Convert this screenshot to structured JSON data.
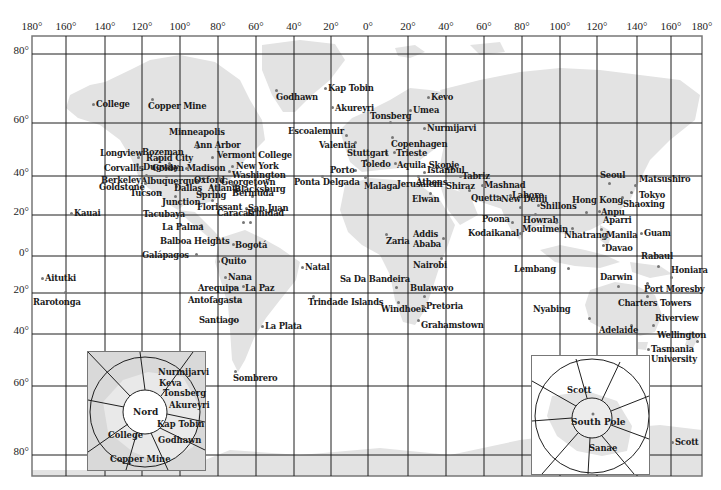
{
  "map": {
    "frame": {
      "left": 32,
      "top": 36,
      "right": 702,
      "bottom": 476
    },
    "colors": {
      "land": "#e3e3e3",
      "grid": "#1f1f1f",
      "frame": "#777777",
      "dot": "#777777",
      "background": "#ffffff"
    },
    "longitude_ticks": [
      {
        "label": "180°",
        "x": 32
      },
      {
        "label": "160°",
        "x": 66
      },
      {
        "label": "140°",
        "x": 105
      },
      {
        "label": "120°",
        "x": 142
      },
      {
        "label": "100°",
        "x": 180
      },
      {
        "label": "80°",
        "x": 218
      },
      {
        "label": "60°",
        "x": 256
      },
      {
        "label": "40°",
        "x": 294
      },
      {
        "label": "20°",
        "x": 331
      },
      {
        "label": "0°",
        "x": 368
      },
      {
        "label": "20°",
        "x": 408
      },
      {
        "label": "40°",
        "x": 446
      },
      {
        "label": "60°",
        "x": 484
      },
      {
        "label": "80°",
        "x": 522
      },
      {
        "label": "100°",
        "x": 560
      },
      {
        "label": "120°",
        "x": 597
      },
      {
        "label": "140°",
        "x": 637
      },
      {
        "label": "160°",
        "x": 671
      },
      {
        "label": "180°",
        "x": 702
      }
    ],
    "latitude_ticks": [
      {
        "label": "80°",
        "y": 54
      },
      {
        "label": "60°",
        "y": 123
      },
      {
        "label": "40°",
        "y": 176
      },
      {
        "label": "20°",
        "y": 215
      },
      {
        "label": "0°",
        "y": 256
      },
      {
        "label": "20°",
        "y": 293
      },
      {
        "label": "40°",
        "y": 334
      },
      {
        "label": "60°",
        "y": 386
      },
      {
        "label": "80°",
        "y": 455
      }
    ],
    "stations": [
      {
        "name": "College",
        "x": 93,
        "y": 104,
        "dx": 3,
        "dy": -4
      },
      {
        "name": "Copper Mine",
        "x": 152,
        "y": 99,
        "dx": -4,
        "dy": 3
      },
      {
        "name": "Godhawn",
        "x": 276,
        "y": 90,
        "dx": 0,
        "dy": 3
      },
      {
        "name": "Kap Tobin",
        "x": 325,
        "y": 88,
        "dx": 3,
        "dy": -4
      },
      {
        "name": "Akureyri",
        "x": 332,
        "y": 107,
        "dx": 3,
        "dy": -3
      },
      {
        "name": "Kevo",
        "x": 428,
        "y": 97,
        "dx": 3,
        "dy": -4
      },
      {
        "name": "Umea",
        "x": 410,
        "y": 110,
        "dx": 3,
        "dy": -4
      },
      {
        "name": "Tonsberg",
        "x": 390,
        "y": 122,
        "dx": -20,
        "dy": -10
      },
      {
        "name": "Nurmijarvi",
        "x": 424,
        "y": 128,
        "dx": 3,
        "dy": -4
      },
      {
        "name": "Escoalemuir",
        "x": 346,
        "y": 135,
        "dx": -58,
        "dy": -8
      },
      {
        "name": "Copenhagen",
        "x": 392,
        "y": 137,
        "dx": -1,
        "dy": 3
      },
      {
        "name": "Valentia",
        "x": 355,
        "y": 142,
        "dx": -36,
        "dy": -1
      },
      {
        "name": "Stuttgart",
        "x": 386,
        "y": 153,
        "dx": -39,
        "dy": -4
      },
      {
        "name": "Trieste",
        "x": 394,
        "y": 152,
        "dx": 2,
        "dy": -3
      },
      {
        "name": "Toledo",
        "x": 366,
        "y": 160,
        "dx": -5,
        "dy": 0
      },
      {
        "name": "Aquila Skopje",
        "x": 395,
        "y": 163,
        "dx": 2,
        "dy": -2
      },
      {
        "name": "Porto",
        "x": 355,
        "y": 170,
        "dx": -25,
        "dy": -4
      },
      {
        "name": "Malaga",
        "x": 365,
        "y": 177,
        "dx": -1,
        "dy": 5
      },
      {
        "name": "Ponta Delgada",
        "x": 322,
        "y": 176,
        "dx": -28,
        "dy": 2
      },
      {
        "name": "Istanbul",
        "x": 424,
        "y": 172,
        "dx": 3,
        "dy": -6
      },
      {
        "name": "Athens",
        "x": 418,
        "y": 176,
        "dx": -2,
        "dy": 2
      },
      {
        "name": "Tabriz",
        "x": 460,
        "y": 176,
        "dx": 2,
        "dy": -4
      },
      {
        "name": "Jerusalem",
        "x": 434,
        "y": 185,
        "dx": -37,
        "dy": -5
      },
      {
        "name": "Shiraz",
        "x": 469,
        "y": 190,
        "dx": -23,
        "dy": -8
      },
      {
        "name": "Elwan",
        "x": 430,
        "y": 193,
        "dx": -18,
        "dy": 2
      },
      {
        "name": "Mashnad",
        "x": 482,
        "y": 185,
        "dx": 2,
        "dy": -4
      },
      {
        "name": "Quetta",
        "x": 497,
        "y": 196,
        "dx": -26,
        "dy": -2
      },
      {
        "name": "Lahore",
        "x": 510,
        "y": 195,
        "dx": 2,
        "dy": -4
      },
      {
        "name": "New Dehli",
        "x": 520,
        "y": 207,
        "dx": -19,
        "dy": -12
      },
      {
        "name": "Poona",
        "x": 512,
        "y": 222,
        "dx": -30,
        "dy": -7
      },
      {
        "name": "Kodaikanal",
        "x": 520,
        "y": 233,
        "dx": -52,
        "dy": -4
      },
      {
        "name": "Shillons",
        "x": 538,
        "y": 205,
        "dx": 2,
        "dy": -3
      },
      {
        "name": "Howrah",
        "x": 535,
        "y": 214,
        "dx": -12,
        "dy": 2
      },
      {
        "name": "Mouimein",
        "x": 556,
        "y": 222,
        "dx": -34,
        "dy": 3
      },
      {
        "name": "Hong Kong",
        "x": 586,
        "y": 212,
        "dx": -14,
        "dy": -16
      },
      {
        "name": "Nhatrang",
        "x": 572,
        "y": 228,
        "dx": -8,
        "dy": 3
      },
      {
        "name": "Seoul",
        "x": 609,
        "y": 183,
        "dx": -9,
        "dy": -12
      },
      {
        "name": "Matsushiro",
        "x": 635,
        "y": 185,
        "dx": 4,
        "dy": -10
      },
      {
        "name": "Tokyo",
        "x": 631,
        "y": 192,
        "dx": 8,
        "dy": -1
      },
      {
        "name": "Shaoxing",
        "x": 622,
        "y": 197,
        "dx": 1,
        "dy": 3
      },
      {
        "name": "Anpu",
        "x": 599,
        "y": 211,
        "dx": 2,
        "dy": -3
      },
      {
        "name": "Aparri",
        "x": 601,
        "y": 229,
        "dx": 2,
        "dy": -13
      },
      {
        "name": "Manila",
        "x": 604,
        "y": 237,
        "dx": 2,
        "dy": -6
      },
      {
        "name": "Davao",
        "x": 603,
        "y": 245,
        "dx": 2,
        "dy": -1
      },
      {
        "name": "Guam",
        "x": 641,
        "y": 233,
        "dx": 3,
        "dy": -4
      },
      {
        "name": "Rabaul",
        "x": 658,
        "y": 266,
        "dx": -17,
        "dy": -14
      },
      {
        "name": "Honiara",
        "x": 671,
        "y": 277,
        "dx": 0,
        "dy": -11
      },
      {
        "name": "Darwin",
        "x": 618,
        "y": 286,
        "dx": -18,
        "dy": -13
      },
      {
        "name": "Port Moresby",
        "x": 647,
        "y": 283,
        "dx": -3,
        "dy": 2
      },
      {
        "name": "Lembang",
        "x": 568,
        "y": 268,
        "dx": -54,
        "dy": -3
      },
      {
        "name": "Charters Towers",
        "x": 647,
        "y": 296,
        "dx": -29,
        "dy": 3
      },
      {
        "name": "Nyabing",
        "x": 589,
        "y": 318,
        "dx": -56,
        "dy": -13
      },
      {
        "name": "Riverview",
        "x": 653,
        "y": 325,
        "dx": 2,
        "dy": -11
      },
      {
        "name": "Adelaide",
        "x": 631,
        "y": 325,
        "dx": -32,
        "dy": 1
      },
      {
        "name": "Wellington",
        "x": 697,
        "y": 341,
        "dx": -40,
        "dy": -10
      },
      {
        "name": "Tasmania",
        "x": 648,
        "y": 349,
        "dx": 3,
        "dy": -4
      },
      {
        "name": "University",
        "x": 648,
        "y": 349,
        "dx": 3,
        "dy": 6,
        "nodot": true
      },
      {
        "name": "Scott",
        "x": 672,
        "y": 442,
        "dx": 3,
        "dy": -4
      },
      {
        "name": "Kauai",
        "x": 71,
        "y": 213,
        "dx": 3,
        "dy": -4
      },
      {
        "name": "Aitutki",
        "x": 42,
        "y": 278,
        "dx": 3,
        "dy": -4
      },
      {
        "name": "Rarotonga",
        "x": 65,
        "y": 292,
        "dx": -32,
        "dy": 6
      },
      {
        "name": "Longview",
        "x": 138,
        "y": 157,
        "dx": -38,
        "dy": -8
      },
      {
        "name": "Bozeman",
        "x": 158,
        "y": 158,
        "dx": -16,
        "dy": -10
      },
      {
        "name": "Corvallis",
        "x": 137,
        "y": 164,
        "dx": -33,
        "dy": 0
      },
      {
        "name": "Dugway",
        "x": 140,
        "y": 167,
        "dx": 3,
        "dy": -4
      },
      {
        "name": "Minneapolis",
        "x": 180,
        "y": 132,
        "dx": -11,
        "dy": -4
      },
      {
        "name": "Ann Arbor",
        "x": 197,
        "y": 147,
        "dx": -3,
        "dy": -6
      },
      {
        "name": "Rapid City",
        "x": 169,
        "y": 163,
        "dx": -23,
        "dy": -9
      },
      {
        "name": "Vermont College",
        "x": 212,
        "y": 157,
        "dx": 5,
        "dy": -6
      },
      {
        "name": "Golden Madison",
        "x": 186,
        "y": 168,
        "dx": -34,
        "dy": -4
      },
      {
        "name": "New York",
        "x": 232,
        "y": 166,
        "dx": 4,
        "dy": -4
      },
      {
        "name": "Washington",
        "x": 229,
        "y": 171,
        "dx": 3,
        "dy": 0
      },
      {
        "name": "Berkeley",
        "x": 146,
        "y": 175,
        "dx": -45,
        "dy": 1
      },
      {
        "name": "Albuquerque",
        "x": 166,
        "y": 176,
        "dx": -25,
        "dy": 1
      },
      {
        "name": "Oxford",
        "x": 203,
        "y": 178,
        "dx": -9,
        "dy": -2
      },
      {
        "name": "Georgetown",
        "x": 219,
        "y": 178,
        "dx": 2,
        "dy": 0
      },
      {
        "name": "Goldstone",
        "x": 145,
        "y": 183,
        "dx": -46,
        "dy": 0
      },
      {
        "name": "Dallas",
        "x": 176,
        "y": 186,
        "dx": -2,
        "dy": -2
      },
      {
        "name": "Atlanta",
        "x": 211,
        "y": 186,
        "dx": -3,
        "dy": -2
      },
      {
        "name": "Blacksburg",
        "x": 232,
        "y": 184,
        "dx": 2,
        "dy": 1
      },
      {
        "name": "Tucson",
        "x": 160,
        "y": 192,
        "dx": -30,
        "dy": -3
      },
      {
        "name": "Junction",
        "x": 175,
        "y": 196,
        "dx": -13,
        "dy": 2
      },
      {
        "name": "Spring",
        "x": 201,
        "y": 193,
        "dx": -5,
        "dy": -2
      },
      {
        "name": "Bermuda",
        "x": 252,
        "y": 196,
        "dx": -20,
        "dy": -7
      },
      {
        "name": "Florissant",
        "x": 212,
        "y": 200,
        "dx": -15,
        "dy": 3
      },
      {
        "name": "San Juan",
        "x": 246,
        "y": 208,
        "dx": 2,
        "dy": -4
      },
      {
        "name": "Tacubaya",
        "x": 178,
        "y": 214,
        "dx": -35,
        "dy": -4
      },
      {
        "name": "Caracas",
        "x": 243,
        "y": 222,
        "dx": -26,
        "dy": -13
      },
      {
        "name": "Trinidad",
        "x": 250,
        "y": 222,
        "dx": -4,
        "dy": -13
      },
      {
        "name": "La Palma",
        "x": 201,
        "y": 225,
        "dx": -39,
        "dy": -2
      },
      {
        "name": "Balboa Heights",
        "x": 218,
        "y": 238,
        "dx": -58,
        "dy": -1
      },
      {
        "name": "Bogotá",
        "x": 233,
        "y": 244,
        "dx": 2,
        "dy": -3
      },
      {
        "name": "Galápagos",
        "x": 196,
        "y": 254,
        "dx": -54,
        "dy": -3
      },
      {
        "name": "Quito",
        "x": 218,
        "y": 261,
        "dx": 3,
        "dy": -4
      },
      {
        "name": "Nana",
        "x": 225,
        "y": 277,
        "dx": 3,
        "dy": -4
      },
      {
        "name": "Arequipa",
        "x": 235,
        "y": 287,
        "dx": -37,
        "dy": -3
      },
      {
        "name": "La Paz",
        "x": 243,
        "y": 286,
        "dx": 2,
        "dy": -2
      },
      {
        "name": "Antofagasta",
        "x": 238,
        "y": 300,
        "dx": -50,
        "dy": -4
      },
      {
        "name": "Santiago",
        "x": 234,
        "y": 320,
        "dx": -35,
        "dy": -4
      },
      {
        "name": "La Plata",
        "x": 262,
        "y": 326,
        "dx": 3,
        "dy": -4
      },
      {
        "name": "Sombrero",
        "x": 235,
        "y": 371,
        "dx": -2,
        "dy": 3
      },
      {
        "name": "Natal",
        "x": 302,
        "y": 267,
        "dx": 3,
        "dy": -4
      },
      {
        "name": "Zaria",
        "x": 386,
        "y": 234,
        "dx": 0,
        "dy": 3
      },
      {
        "name": "Addis",
        "x": 443,
        "y": 238,
        "dx": -30,
        "dy": -8
      },
      {
        "name": "Ababa",
        "x": 443,
        "y": 238,
        "dx": -30,
        "dy": 2,
        "nodot": true
      },
      {
        "name": "Nairobi",
        "x": 441,
        "y": 258,
        "dx": -28,
        "dy": 3
      },
      {
        "name": "Sa Da Bandeira",
        "x": 396,
        "y": 287,
        "dx": -56,
        "dy": -12
      },
      {
        "name": "Bulawayo",
        "x": 424,
        "y": 296,
        "dx": -14,
        "dy": -12
      },
      {
        "name": "Trindade Islands",
        "x": 313,
        "y": 296,
        "dx": -5,
        "dy": 2
      },
      {
        "name": "Windhoek",
        "x": 398,
        "y": 302,
        "dx": -17,
        "dy": 3
      },
      {
        "name": "Pretoria",
        "x": 423,
        "y": 306,
        "dx": 3,
        "dy": -4
      },
      {
        "name": "Grahamstown",
        "x": 418,
        "y": 320,
        "dx": 3,
        "dy": 1
      }
    ],
    "insets": {
      "north": {
        "title": "Nord",
        "box": {
          "left": 87,
          "top": 351,
          "width": 117,
          "height": 118
        },
        "labels": [
          {
            "name": "Nurmijarvi",
            "x": 157,
            "y": 371
          },
          {
            "name": "Keva",
            "x": 158,
            "y": 382
          },
          {
            "name": "Tonsberg",
            "x": 162,
            "y": 392
          },
          {
            "name": "Akureyri",
            "x": 168,
            "y": 404
          },
          {
            "name": "Kap Tobin",
            "x": 156,
            "y": 423
          },
          {
            "name": "College",
            "x": 107,
            "y": 434
          },
          {
            "name": "Godhawn",
            "x": 157,
            "y": 439
          },
          {
            "name": "Copper Mine",
            "x": 109,
            "y": 458
          }
        ]
      },
      "south": {
        "title": "South Pole",
        "box": {
          "left": 531,
          "top": 355,
          "width": 117,
          "height": 118
        },
        "labels": [
          {
            "name": "Scott",
            "x": 566,
            "y": 389
          },
          {
            "name": "Sanae",
            "x": 588,
            "y": 447
          }
        ]
      }
    }
  }
}
